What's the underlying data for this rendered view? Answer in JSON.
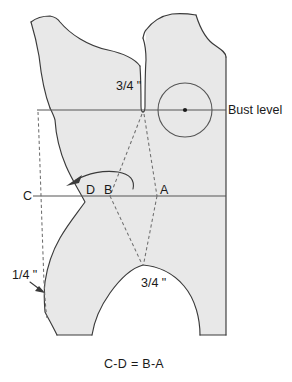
{
  "figure": {
    "type": "sewing-pattern-diagram",
    "caption": "C-D = B-A",
    "colors": {
      "pattern_fill": "#e8e8e8",
      "outline": "#3a3a3a",
      "dashed_line": "#6e6e6e",
      "guide_line": "#555555",
      "text": "#1a1a1a",
      "background": "#ffffff"
    },
    "labels": {
      "neck_measure": "3/4 \"",
      "bust_level": "Bust level",
      "point_c": "C",
      "point_d": "D",
      "point_b": "B",
      "point_a": "A",
      "quarter_measure": "1/4 \"",
      "armhole_measure": "3/4 \""
    },
    "annotations": {
      "bust_apex_marker": "bust-point-circle",
      "rotate_arrow": "curved-arrow-left",
      "seam_arrow": "arrow-to-side-seam"
    }
  }
}
